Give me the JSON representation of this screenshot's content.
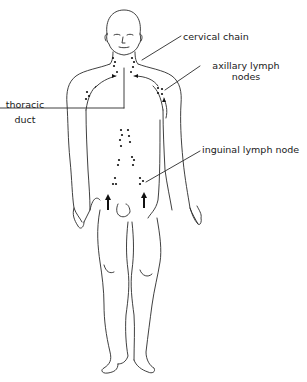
{
  "diagram": {
    "labels": {
      "cervical_chain": "cervical chain",
      "axillary_line1": "axillary lymph",
      "axillary_line2": "nodes",
      "thoracic_line1": "thoracic",
      "thoracic_line2": "duct",
      "inguinal": "inguinal lymph node"
    },
    "colors": {
      "line": "#2a2a2a",
      "node": "#111111",
      "text": "#1a1a1a",
      "background": "#ffffff"
    }
  }
}
